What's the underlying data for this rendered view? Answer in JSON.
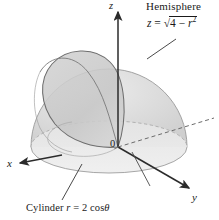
{
  "figure": {
    "title_label": "Hemisphere",
    "equation_plain": "z = sqrt(4 - r^2)",
    "equation_parts": {
      "lhs": "z",
      "eq": "=",
      "radicand_lead": "4 − ",
      "radicand_var": "r",
      "radicand_exp": "2",
      "radical": "√"
    },
    "cylinder_label_plain": "Cylinder r = 2 cos θ",
    "cylinder_parts": {
      "word": "Cylinder",
      "var": "r",
      "eq": "=",
      "value": "2 cos",
      "theta": "θ"
    },
    "axes": {
      "x_label": "x",
      "y_label": "y",
      "z_label": "z",
      "origin_label": "0"
    },
    "colors": {
      "sphere_fill": "#d9d9d9",
      "sphere_fill_light": "#e6e6e6",
      "cylinder_fill": "#c9c9c9",
      "base_fill": "#e9e9e9",
      "outline": "#8a8a8a",
      "curve": "#6e6e6e",
      "axis": "#2b2b2b",
      "dashed_axis": "#6b6b6b",
      "background": "#ffffff",
      "text": "#1a1a1a"
    },
    "geometry_notes": {
      "hemisphere_radius_value": 2,
      "cylinder_equation_r": "2 cos theta",
      "intersection_name": "Viviani-type curve"
    }
  }
}
